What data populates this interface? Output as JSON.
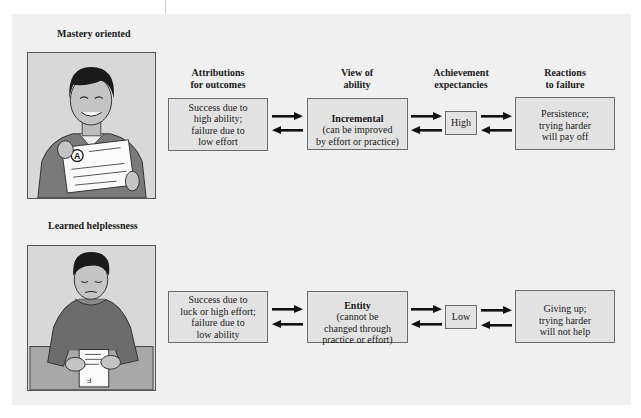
{
  "columns": [
    {
      "heading": "Attributions\nfor outcomes"
    },
    {
      "heading": "View of\nability"
    },
    {
      "heading": "Achievement\nexpectancies"
    },
    {
      "heading": "Reactions\nto failure"
    }
  ],
  "rows": [
    {
      "title": "Mastery oriented",
      "illustration": "smiling-student-holding-A-paper",
      "grade_mark": "A",
      "attribution": "Success due to\nhigh ability;\nfailure due to\nlow effort",
      "view_title": "Incremental",
      "view_desc": "(can be improved\nby effort or practice)",
      "expectancy": "High",
      "reaction": "Persistence;\ntrying harder\nwill pay off"
    },
    {
      "title": "Learned helplessness",
      "illustration": "downcast-student-with-F-paper",
      "grade_mark": "F",
      "attribution": "Success due to\nluck or high effort;\nfailure due to\nlow ability",
      "view_title": "Entity",
      "view_desc": "(cannot be\nchanged through\npractice or effort)",
      "expectancy": "Low",
      "reaction": "Giving up;\ntrying harder\nwill not help"
    }
  ],
  "colors": {
    "panel_bg": "#f0f0f0",
    "box_fill": "#e2e2e2",
    "box_border": "#6b6b6b",
    "arrow": "#111111"
  }
}
